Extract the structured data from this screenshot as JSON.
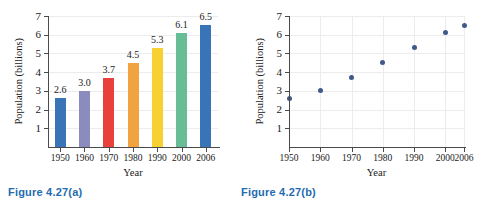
{
  "figure_a": {
    "caption": "Figure  4.27(a)",
    "chart": {
      "type": "bar",
      "title": "",
      "xlabel": "Year",
      "ylabel": "Population (billions)",
      "categories": [
        "1950",
        "1960",
        "1970",
        "1980",
        "1990",
        "2000",
        "2006"
      ],
      "values": [
        2.6,
        3.0,
        3.7,
        4.5,
        5.3,
        6.1,
        6.5
      ],
      "value_labels": [
        "2.6",
        "3.0",
        "3.7",
        "4.5",
        "5.3",
        "6.1",
        "6.5"
      ],
      "ylim": [
        0,
        7
      ],
      "yticks": [
        "1",
        "2",
        "3",
        "4",
        "5",
        "6",
        "7"
      ],
      "bar_colors": [
        "#3a74b8",
        "#8b8bbd",
        "#e8413c",
        "#f0a340",
        "#f7d032",
        "#69bd96",
        "#3a74b8"
      ],
      "grid": "horizontal",
      "legend": "none"
    }
  },
  "figure_b": {
    "caption": "Figure  4.27(b)",
    "chart": {
      "type": "scatter",
      "title": "",
      "xlabel": "Year",
      "ylabel": "Population (billions)",
      "x": [
        1950,
        1960,
        1970,
        1980,
        1990,
        2000,
        2006
      ],
      "y": [
        2.6,
        3.0,
        3.7,
        4.5,
        5.3,
        6.1,
        6.5
      ],
      "xticks": [
        "1950",
        "1960",
        "1970",
        "1980",
        "1990",
        "2000",
        "2006"
      ],
      "ylim": [
        0,
        7
      ],
      "yticks": [
        "1",
        "2",
        "3",
        "4",
        "5",
        "6",
        "7"
      ],
      "point_color": "#3f5a8a",
      "grid": "both",
      "legend": "none"
    }
  },
  "colors": {
    "caption": "#1f6bb0",
    "axis": "#4a4a4a",
    "grid": "#ececec",
    "background": "#ffffff"
  }
}
